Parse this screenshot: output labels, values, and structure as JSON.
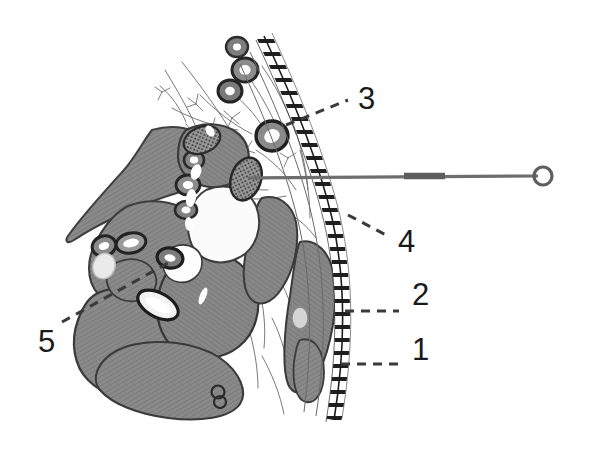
{
  "figure": {
    "type": "anatomical-cross-section-illustration",
    "title": "",
    "background_color": "#ffffff",
    "width": 590,
    "height": 457,
    "palette": {
      "muscle_fill": "#858585",
      "muscle_hatch": "#6f6f6f",
      "outline_dark": "#2b2b2b",
      "outline_mid": "#4a4a4a",
      "vessel_fill": "#8a8a8a",
      "vessel_lumen": "#ffffff",
      "nerve_speckle": "#3a3a3a",
      "needle_gray": "#6e6e6e",
      "label_color": "#1a1a1a",
      "leader_color": "#3a3a3a",
      "fascia_line": "#555555"
    },
    "labels": [
      {
        "id": "label-1",
        "text": "1",
        "x": 412,
        "y": 349,
        "leader": {
          "style": "dashed",
          "x1": 341,
          "y1": 364,
          "x2": 399,
          "y2": 364
        }
      },
      {
        "id": "label-2",
        "text": "2",
        "x": 412,
        "y": 294,
        "leader": {
          "style": "dashed",
          "x1": 345,
          "y1": 311,
          "x2": 399,
          "y2": 311
        }
      },
      {
        "id": "label-3",
        "text": "3",
        "x": 358,
        "y": 83,
        "leader": {
          "style": "dashed",
          "x1": 286,
          "y1": 125,
          "x2": 348,
          "y2": 100
        }
      },
      {
        "id": "label-4",
        "text": "4",
        "x": 398,
        "y": 226,
        "leader": {
          "style": "dashed",
          "x1": 348,
          "y1": 215,
          "x2": 388,
          "y2": 236
        }
      },
      {
        "id": "label-5",
        "text": "5",
        "x": 38,
        "y": 326,
        "leader": {
          "style": "dashed",
          "x1": 62,
          "y1": 322,
          "x2": 168,
          "y2": 263
        }
      }
    ],
    "needle": {
      "name": "injection-needle",
      "tip_x": 248,
      "tip_y": 178,
      "hub_center_x": 543,
      "hub_center_y": 176,
      "hub_radius": 9,
      "shaft_color": "#6e6e6e",
      "thick_segment": {
        "x1": 404,
        "y1": 176,
        "x2": 445,
        "y2": 176
      }
    }
  }
}
